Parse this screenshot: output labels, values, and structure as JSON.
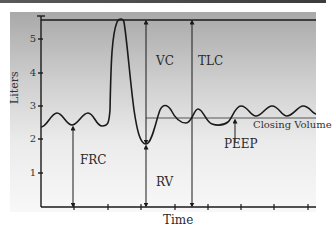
{
  "diagram": {
    "title": "",
    "y_axis": {
      "label": "Liters",
      "ticks": [
        "1",
        "2",
        "3",
        "4",
        "5"
      ]
    },
    "x_axis": {
      "label": "Time"
    },
    "annotations": {
      "vc": "VC",
      "tlc": "TLC",
      "frc": "FRC",
      "rv": "RV",
      "peep": "PEEP",
      "closing_volume": "Closing Volume"
    },
    "colors": {
      "line": "#1a1a1a",
      "background_top": "#a9a9a9",
      "background_bottom": "#f8f8f8"
    }
  }
}
